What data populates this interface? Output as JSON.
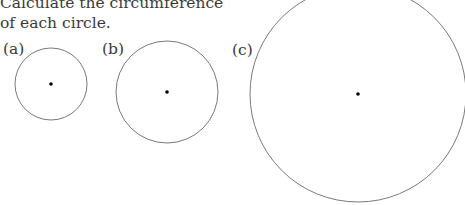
{
  "question": {
    "line1": "Calculate the circumference",
    "line2": "of each circle."
  },
  "circles": [
    {
      "label": "(a)",
      "cx": 51,
      "cy": 84,
      "r": 36
    },
    {
      "label": "(b)",
      "cx": 167,
      "cy": 92,
      "r": 51
    },
    {
      "label": "(c)",
      "cx": 358,
      "cy": 94,
      "r": 108
    }
  ],
  "colors": {
    "stroke": "#7a7a7a",
    "center": "#000000",
    "text": "#3a3a3a"
  }
}
